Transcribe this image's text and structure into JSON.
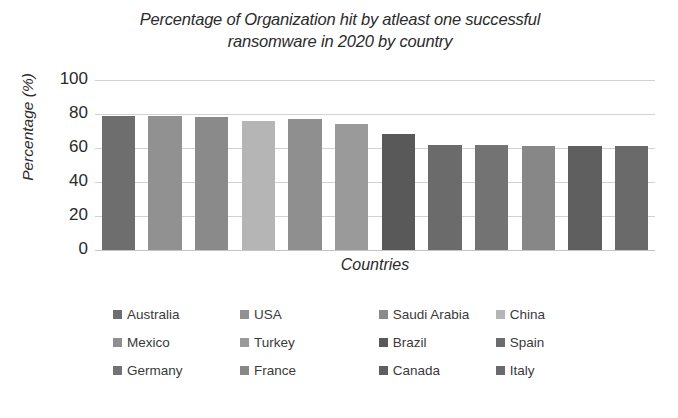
{
  "chart_data": {
    "type": "bar",
    "title": "Percentage of Organization hit by atleast one successful ransomware in 2020 by country",
    "title_line1": "Percentage of Organization hit by atleast one successful",
    "title_line2": "ransomware in 2020 by country",
    "xlabel": "Countries",
    "ylabel": "Percentage (%)",
    "ylim": [
      0,
      100
    ],
    "yticks": [
      100,
      80,
      60,
      40,
      20,
      0
    ],
    "grid": true,
    "legend_position": "bottom",
    "categories": [
      "Australia",
      "USA",
      "Saudi Arabia",
      "China",
      "Mexico",
      "Turkey",
      "Brazil",
      "Spain",
      "Germany",
      "France",
      "Canada",
      "Italy"
    ],
    "values": [
      79,
      79,
      78,
      76,
      77,
      74,
      68,
      62,
      62,
      61,
      61,
      61
    ],
    "colors": [
      "#6e6e6e",
      "#919191",
      "#8a8a8a",
      "#b5b5b5",
      "#8f8f8f",
      "#9a9a9a",
      "#595959",
      "#6b6b6b",
      "#737373",
      "#878787",
      "#5f5f5f",
      "#6a6a6a"
    ]
  },
  "legend": {
    "rows": [
      [
        {
          "label": "Australia",
          "color": "#6e6e6e"
        },
        {
          "label": "USA",
          "color": "#919191"
        },
        {
          "label": "Saudi Arabia",
          "color": "#8a8a8a"
        },
        {
          "label": "China",
          "color": "#b5b5b5"
        }
      ],
      [
        {
          "label": "Mexico",
          "color": "#8f8f8f"
        },
        {
          "label": "Turkey",
          "color": "#9a9a9a"
        },
        {
          "label": "Brazil",
          "color": "#595959"
        },
        {
          "label": "Spain",
          "color": "#6b6b6b"
        }
      ],
      [
        {
          "label": "Germany",
          "color": "#737373"
        },
        {
          "label": "France",
          "color": "#878787"
        },
        {
          "label": "Canada",
          "color": "#5f5f5f"
        },
        {
          "label": "Italy",
          "color": "#6a6a6a"
        }
      ]
    ]
  }
}
